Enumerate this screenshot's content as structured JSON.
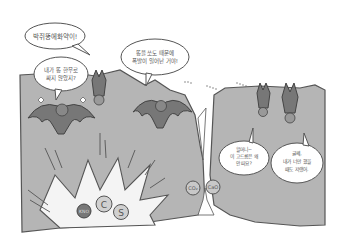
{
  "scene": {
    "description": "Cartoon of bats in a cave; gunpowder explosion and limestone formation",
    "colors": {
      "background": "#ffffff",
      "cave_rock": "#b5b5b5",
      "outline": "#555555",
      "bat_body": "#777777",
      "explosion": "#f4f4f4",
      "bubble_fill": "#ffffff",
      "bubble_text": "#666666"
    }
  },
  "bubbles": [
    {
      "id": "gunpowder-shout",
      "lines": [
        "박쥐똥에화약이!"
      ]
    },
    {
      "id": "bat-left",
      "lines": [
        "내가 똥 한무로",
        "싸지 않았지?"
      ]
    },
    {
      "id": "bat-middle",
      "lines": [
        "똥을 쏘도 때문에",
        "폭발이 일어난 거야!"
      ]
    },
    {
      "id": "child-bat",
      "lines": [
        "할머니~",
        "이 고드름은 왜",
        "안 떠요?"
      ]
    },
    {
      "id": "grandma-bat",
      "lines": [
        "글쎄,",
        "내가 너만 했을",
        "때도 저랬어."
      ]
    }
  ],
  "molecules": {
    "explosion": [
      "KNO",
      "C",
      "S"
    ],
    "cave_gap": [
      "CO₂",
      "CaO"
    ]
  }
}
